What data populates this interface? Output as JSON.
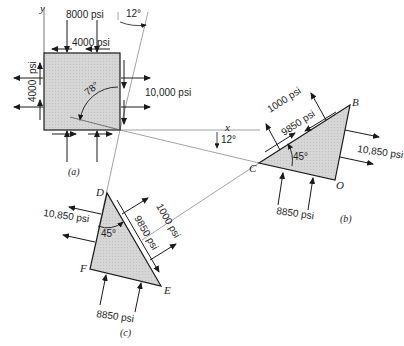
{
  "figure": {
    "colors": {
      "fill": "#d4d4d4",
      "stroke": "#1a1a1a",
      "line": "#888888"
    },
    "element_a": {
      "caption": "(a)",
      "axis_y": "y",
      "sigma_y": "8000 psi",
      "tau_top": "4000 psi",
      "tau_side_value": "4000",
      "tau_side_unit": "psi",
      "sigma_x": "10,000 psi",
      "angle_inner": "78°",
      "angle_top": "12°"
    },
    "axes": {
      "x_label": "x",
      "angle_x": "12°"
    },
    "element_b": {
      "caption": "(b)",
      "vertices": {
        "B": "B",
        "C": "C",
        "O": "O"
      },
      "normal_stress": "1000 psi",
      "shear_stress": "9850 psi",
      "right_stress": "10,850 psi",
      "bottom_stress": "8850 psi",
      "angle": "45°"
    },
    "element_c": {
      "caption": "(c)",
      "vertices": {
        "D": "D",
        "E": "E",
        "F": "F"
      },
      "normal_stress": "1000 psi",
      "shear_stress": "9850 psi",
      "left_stress": "10,850 psi",
      "bottom_stress": "8850 psi",
      "angle": "45°"
    }
  }
}
